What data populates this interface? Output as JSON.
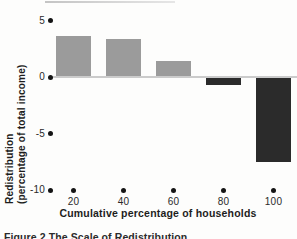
{
  "caption": {
    "text": "Figure 2  The Scale of Redistribution"
  },
  "chart_data": {
    "type": "bar",
    "title": "",
    "categories": [
      "20",
      "40",
      "60",
      "80",
      "100"
    ],
    "values": [
      3.5,
      3.3,
      1.3,
      -0.7,
      -7.5
    ],
    "xlabel": "Cumulative percentage of households",
    "ylabel_line1": "Redistribution",
    "ylabel_line2": "(percentage of total income)",
    "ytick_labels": [
      "5",
      "0",
      "-5",
      "-10"
    ],
    "ytick_values": [
      5,
      0,
      -5,
      -10
    ],
    "ylim": [
      -10,
      5
    ],
    "grid": false,
    "legend": false,
    "colors": {
      "positive_bar": "#9b9b9b",
      "negative_bar": "#2b2b2b",
      "tick_dot": "#141414",
      "zero_line": "#cbcbcb"
    }
  }
}
